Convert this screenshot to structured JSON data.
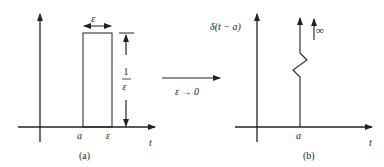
{
  "left_panel": {
    "caption": "(a)",
    "x_axis_label": "t",
    "tick_a": "a",
    "tick_eps": "ε",
    "width_label": "ε",
    "height_num": "1",
    "height_den": "ε"
  },
  "middle": {
    "limit_label": "ε → 0"
  },
  "right_panel": {
    "caption": "(b)",
    "x_axis_label": "t",
    "tick_a": "a",
    "y_label": "δ(t − a)",
    "infinity_label": "∞"
  },
  "colors": {
    "stroke": "#222222",
    "background": "#ffffff"
  }
}
